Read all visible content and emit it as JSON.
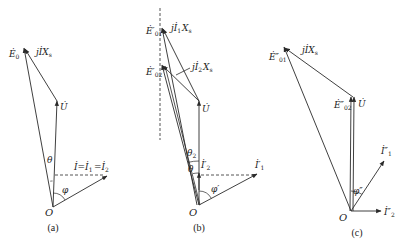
{
  "colors": {
    "ink": "#2a2a2a",
    "background": "#ffffff"
  },
  "panels": [
    {
      "id": "a",
      "caption": "(a)",
      "caption_pos": [
        53,
        231
      ],
      "origin": [
        53,
        207
      ],
      "origin_label": "O",
      "origin_label_pos": [
        45,
        216
      ],
      "vectors": [
        {
          "name": "U",
          "from": [
            53,
            207
          ],
          "to": [
            57,
            101
          ],
          "style": "solid"
        },
        {
          "name": "E0",
          "from": [
            53,
            207
          ],
          "to": [
            24,
            48
          ],
          "style": "solid"
        },
        {
          "name": "jIXs",
          "from": [
            57,
            101
          ],
          "to": [
            25,
            49
          ],
          "style": "solid"
        },
        {
          "name": "I",
          "from": [
            53,
            207
          ],
          "to": [
            107,
            176
          ],
          "style": "solid"
        }
      ],
      "lines": [
        {
          "from": [
            55,
            175
          ],
          "to": [
            105,
            175
          ],
          "style": "dashed"
        }
      ],
      "arcs": [
        {
          "name": "theta-arc",
          "cx": 53,
          "cy": 207,
          "r": 26,
          "a1": -96,
          "a2": -91
        },
        {
          "name": "phi-arc",
          "cx": 53,
          "cy": 207,
          "r": 14,
          "a1": -90,
          "a2": -30
        }
      ],
      "labels": [
        {
          "text": "Ė",
          "sub": "0",
          "x": 9,
          "y": 57
        },
        {
          "text": "jİX",
          "sub": "s",
          "x": 36,
          "y": 55
        },
        {
          "text": "U̇",
          "sub": "",
          "x": 60,
          "y": 110
        },
        {
          "text": "θ",
          "sub": "",
          "x": 47,
          "y": 163
        },
        {
          "text": "İ=İ",
          "sub": "1",
          "x": 74,
          "y": 170
        },
        {
          "text": "=İ",
          "sub": "2",
          "x": 94,
          "y": 170
        },
        {
          "text": "φ",
          "sub": "",
          "x": 62,
          "y": 193
        }
      ]
    },
    {
      "id": "b",
      "caption": "(b)",
      "caption_pos": [
        199,
        231
      ],
      "origin": [
        199,
        205
      ],
      "origin_label": "O",
      "origin_label_pos": [
        189,
        216
      ],
      "vectors": [
        {
          "name": "U",
          "from": [
            199,
            205
          ],
          "to": [
            199,
            101
          ],
          "style": "solid"
        },
        {
          "name": "E01-prime",
          "from": [
            197,
            205
          ],
          "to": [
            162,
            28
          ],
          "style": "solid"
        },
        {
          "name": "E02-prime",
          "from": [
            199,
            205
          ],
          "to": [
            162,
            65
          ],
          "style": "solid"
        },
        {
          "name": "jI1Xs",
          "from": [
            199,
            101
          ],
          "to": [
            163,
            29
          ],
          "style": "solid"
        },
        {
          "name": "jI2Xs",
          "from": [
            199,
            101
          ],
          "to": [
            163,
            66
          ],
          "style": "solid"
        },
        {
          "name": "I1-prime",
          "from": [
            199,
            205
          ],
          "to": [
            257,
            174
          ],
          "style": "solid"
        },
        {
          "name": "I2-prime",
          "from": [
            199,
            190
          ],
          "to": [
            199,
            173
          ],
          "style": "solid"
        }
      ],
      "lines": [
        {
          "from": [
            160,
            8
          ],
          "to": [
            160,
            140
          ],
          "style": "dashed"
        },
        {
          "from": [
            201,
            175
          ],
          "to": [
            255,
            175
          ],
          "style": "dashed"
        },
        {
          "from": [
            200,
            205
          ],
          "to": [
            165,
            66
          ],
          "style": "solid"
        },
        {
          "from": [
            176,
            75
          ],
          "to": [
            190,
            68
          ],
          "style": "solid"
        }
      ],
      "arcs": [
        {
          "name": "theta2-arc",
          "cx": 199,
          "cy": 205,
          "r": 44,
          "a1": -104,
          "a2": -90
        },
        {
          "name": "theta1-arc",
          "cx": 199,
          "cy": 205,
          "r": 32,
          "a1": -101,
          "a2": -90
        },
        {
          "name": "phi-prime-arc",
          "cx": 199,
          "cy": 205,
          "r": 14,
          "a1": -90,
          "a2": -28
        }
      ],
      "labels": [
        {
          "text": "Ė′",
          "sub": "01",
          "x": 146,
          "y": 34
        },
        {
          "text": "jİ",
          "sub": "1",
          "x": 171,
          "y": 31
        },
        {
          "text": "X",
          "sub": "s",
          "x": 182,
          "y": 31
        },
        {
          "text": "Ė′",
          "sub": "02",
          "x": 146,
          "y": 75
        },
        {
          "text": "jİ",
          "sub": "2",
          "x": 192,
          "y": 70
        },
        {
          "text": "X",
          "sub": "s",
          "x": 203,
          "y": 70
        },
        {
          "text": "U̇",
          "sub": "",
          "x": 202,
          "y": 112
        },
        {
          "text": "θ",
          "sub": "2",
          "x": 187,
          "y": 156
        },
        {
          "text": "θ",
          "sub": "",
          "x": 188,
          "y": 172
        },
        {
          "text": "İ′",
          "sub": "2",
          "x": 201,
          "y": 168
        },
        {
          "text": "İ′",
          "sub": "1",
          "x": 255,
          "y": 168
        },
        {
          "text": "φ′",
          "sub": "",
          "x": 211,
          "y": 192
        }
      ]
    },
    {
      "id": "c",
      "caption": "(c)",
      "caption_pos": [
        357,
        236
      ],
      "origin": [
        351,
        211
      ],
      "origin_label": "O",
      "origin_label_pos": [
        339,
        221
      ],
      "vectors": [
        {
          "name": "U",
          "from": [
            353,
            211
          ],
          "to": [
            354,
            97
          ],
          "style": "solid"
        },
        {
          "name": "E02-double-prime",
          "from": [
            350,
            211
          ],
          "to": [
            351,
            97
          ],
          "style": "solid"
        },
        {
          "name": "E01-double-prime",
          "from": [
            351,
            211
          ],
          "to": [
            284,
            47
          ],
          "style": "solid"
        },
        {
          "name": "jIXs",
          "from": [
            353,
            97
          ],
          "to": [
            285,
            48
          ],
          "style": "solid"
        },
        {
          "name": "I1-double-prime",
          "from": [
            351,
            211
          ],
          "to": [
            384,
            161
          ],
          "style": "solid"
        },
        {
          "name": "I2-double-prime",
          "from": [
            351,
            211
          ],
          "to": [
            381,
            211
          ],
          "style": "solid"
        }
      ],
      "lines": [],
      "arcs": [
        {
          "name": "phi-double-prime-arc",
          "cx": 351,
          "cy": 211,
          "r": 20,
          "a1": -90,
          "a2": -57
        }
      ],
      "labels": [
        {
          "text": "Ė″",
          "sub": "01",
          "x": 269,
          "y": 60
        },
        {
          "text": "jİX",
          "sub": "s",
          "x": 302,
          "y": 53
        },
        {
          "text": "Ė″",
          "sub": "02",
          "x": 334,
          "y": 108
        },
        {
          "text": "U̇",
          "sub": "",
          "x": 358,
          "y": 107
        },
        {
          "text": "İ″",
          "sub": "1",
          "x": 381,
          "y": 154
        },
        {
          "text": "φ″",
          "sub": "",
          "x": 353,
          "y": 194
        },
        {
          "text": "İ″",
          "sub": "2",
          "x": 384,
          "y": 215
        }
      ]
    }
  ]
}
